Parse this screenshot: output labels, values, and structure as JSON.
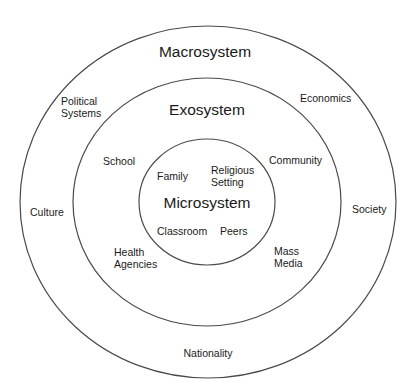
{
  "diagram": {
    "type": "concentric-circles",
    "line_color": "#444444",
    "rings": [
      {
        "id": "macro",
        "title": "Macrosystem",
        "cx": 208,
        "cy": 202,
        "rx": 188,
        "ry": 176
      },
      {
        "id": "exo",
        "title": "Exosystem",
        "cx": 207,
        "cy": 202,
        "rx": 134,
        "ry": 124
      },
      {
        "id": "micro",
        "title": "Microsystem",
        "cx": 207,
        "cy": 202,
        "rx": 68,
        "ry": 63
      }
    ],
    "macrosystem": {
      "title": "Macrosystem",
      "items": {
        "political_1": "Political",
        "political_2": "Systems",
        "economics": "Economics",
        "culture": "Culture",
        "society": "Society",
        "nationality": "Nationality"
      }
    },
    "exosystem": {
      "title": "Exosystem",
      "items": {
        "school": "School",
        "community": "Community",
        "health_1": "Health",
        "health_2": "Agencies",
        "mass_1": "Mass",
        "mass_2": "Media"
      }
    },
    "microsystem": {
      "title": "Microsystem",
      "items": {
        "family": "Family",
        "religious_1": "Religious",
        "religious_2": "Setting",
        "classroom": "Classroom",
        "peers": "Peers"
      }
    }
  }
}
